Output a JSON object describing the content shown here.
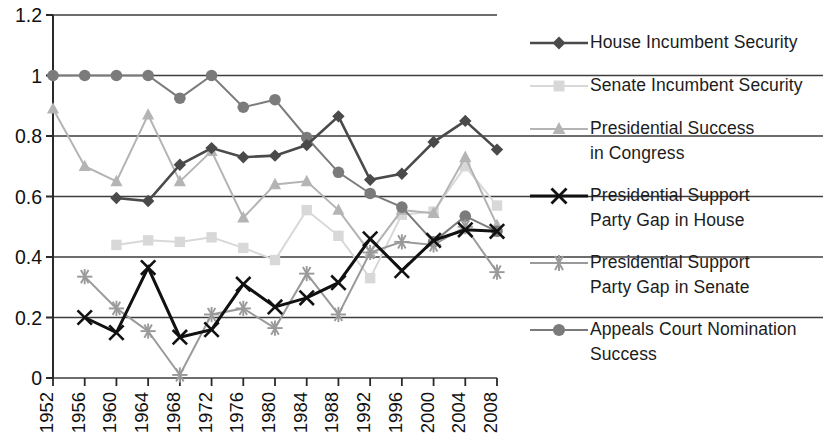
{
  "chart_data": {
    "type": "line",
    "title": "",
    "xlabel": "",
    "ylabel": "",
    "grid": true,
    "legend_position": "right",
    "xlim": [
      1952,
      2008
    ],
    "ylim": [
      0,
      1.2
    ],
    "ytick_labels": [
      "1.2",
      "1",
      "0.8",
      "0.6",
      "0.4",
      "0.2",
      "0"
    ],
    "ytick_values": [
      1.2,
      1.0,
      0.8,
      0.6,
      0.4,
      0.2,
      0
    ],
    "categories": [
      1952,
      1956,
      1960,
      1964,
      1968,
      1972,
      1976,
      1980,
      1984,
      1988,
      1992,
      1996,
      2000,
      2004,
      2008
    ],
    "xtick_labels": [
      "1952",
      "1956",
      "1960",
      "1964",
      "1968",
      "1972",
      "1976",
      "1980",
      "1984",
      "1988",
      "1992",
      "1996",
      "2000",
      "2004",
      "2008"
    ],
    "series": [
      {
        "name": "House Incumbent Security",
        "marker": "diamond",
        "color": "#4a4a4a",
        "values": [
          null,
          null,
          0.595,
          0.585,
          0.705,
          0.76,
          0.73,
          0.735,
          0.77,
          0.865,
          0.655,
          0.675,
          0.78,
          0.85,
          0.755
        ]
      },
      {
        "name": "Senate Incumbent Security",
        "marker": "square",
        "color": "#d8d8d8",
        "values": [
          null,
          null,
          0.44,
          0.455,
          0.45,
          0.465,
          0.43,
          0.39,
          0.555,
          0.47,
          0.33,
          0.54,
          0.55,
          0.7,
          0.57
        ]
      },
      {
        "name": "Presidential Success\nin Congress",
        "marker": "triangle",
        "color": "#b4b4b4",
        "values": [
          0.89,
          0.7,
          0.65,
          0.87,
          0.65,
          0.75,
          0.53,
          0.64,
          0.65,
          0.555,
          0.415,
          0.555,
          0.545,
          0.73,
          0.505
        ]
      },
      {
        "name": "Presidential Support\nParty Gap in House",
        "marker": "cross",
        "color": "#111111",
        "values": [
          null,
          0.2,
          0.15,
          0.365,
          0.135,
          0.16,
          0.31,
          0.235,
          0.265,
          0.315,
          0.46,
          0.355,
          0.455,
          0.49,
          0.485
        ]
      },
      {
        "name": "Presidential Support\nParty Gap in Senate",
        "marker": "star",
        "color": "#9a9a9a",
        "values": [
          null,
          0.335,
          0.23,
          0.155,
          0.01,
          0.21,
          0.23,
          0.165,
          0.345,
          0.21,
          0.415,
          0.45,
          0.44,
          0.5,
          0.35
        ]
      },
      {
        "name": "Appeals Court Nomination\nSuccess",
        "marker": "circle",
        "color": "#7b7b7b",
        "values": [
          1.0,
          1.0,
          1.0,
          1.0,
          0.925,
          1.0,
          0.895,
          0.92,
          0.795,
          0.68,
          0.61,
          0.565,
          0.45,
          0.535,
          0.485
        ]
      }
    ]
  },
  "legend": {
    "items": [
      {
        "label": "House Incumbent Security",
        "marker": "diamond",
        "color": "#4a4a4a"
      },
      {
        "label": "Senate Incumbent Security",
        "marker": "square",
        "color": "#d8d8d8"
      },
      {
        "label": "Presidential Success\nin Congress",
        "marker": "triangle",
        "color": "#b4b4b4"
      },
      {
        "label": "Presidential Support\nParty Gap in House",
        "marker": "cross",
        "color": "#111111"
      },
      {
        "label": "Presidential Support\nParty Gap in Senate",
        "marker": "star",
        "color": "#9a9a9a"
      },
      {
        "label": "Appeals Court Nomination\nSuccess",
        "marker": "circle",
        "color": "#7b7b7b"
      }
    ]
  }
}
